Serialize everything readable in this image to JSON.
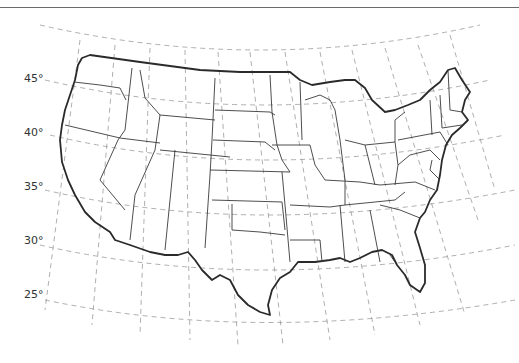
{
  "map": {
    "title": "",
    "type": "outline map",
    "region": "Contiguous United States",
    "projection_grid": "conic (dashed graticule)",
    "latitude_labels": [
      {
        "label": "45°",
        "x": 24,
        "y": 72
      },
      {
        "label": "40°",
        "x": 24,
        "y": 126
      },
      {
        "label": "35°",
        "x": 24,
        "y": 180
      },
      {
        "label": "30°",
        "x": 24,
        "y": 234
      },
      {
        "label": "25°",
        "x": 24,
        "y": 288
      }
    ],
    "colors": {
      "background": "#ffffff",
      "grid": "#9a9a9a",
      "outline": "#2a2a2a",
      "state_borders": "#3a3a3a",
      "top_rule": "#6b6b6b"
    }
  }
}
